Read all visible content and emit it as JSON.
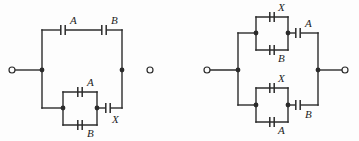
{
  "figure": {
    "background_color": "#fdfdfd",
    "line_color": "#2b2b2b",
    "label_color": "#1e1e1e",
    "width": 359,
    "height": 141
  },
  "circuits": [
    {
      "id": "left-circuit",
      "name": "left-capacitor-network",
      "description": "Series-parallel capacitor network: top branch has A and B in series; bottom branch has A parallel with B, in series with X.",
      "terminals": [
        {
          "name": "left-terminal",
          "cx": 12,
          "cy": 70,
          "r": 3
        },
        {
          "name": "right-terminal",
          "cx": 150,
          "cy": 70,
          "r": 3
        }
      ],
      "junctions": [
        {
          "name": "left-junction",
          "cx": 42,
          "cy": 70,
          "r": 2.4
        },
        {
          "name": "right-junction",
          "cx": 122,
          "cy": 70,
          "r": 2.4
        },
        {
          "name": "parallel-left-node",
          "cx": 63,
          "cy": 108,
          "r": 2.4
        },
        {
          "name": "parallel-right-node",
          "cx": 97,
          "cy": 108,
          "r": 2.4
        }
      ],
      "wires": [
        {
          "name": "left-terminal-lead",
          "d": "M 12 70 L 42 70"
        },
        {
          "name": "left-rail",
          "d": "M 42 30 L 42 108"
        },
        {
          "name": "top-branch-left",
          "d": "M 42 30 L 60 30"
        },
        {
          "name": "top-branch-middle",
          "d": "M 66 30 L 101 30"
        },
        {
          "name": "top-branch-right",
          "d": "M 107 30 L 122 30"
        },
        {
          "name": "right-rail",
          "d": "M 122 30 L 122 108"
        },
        {
          "name": "bottom-branch-left",
          "d": "M 42 108 L 63 108"
        },
        {
          "name": "parallel-box-top",
          "d": "M 63 92 L 97 92"
        },
        {
          "name": "parallel-box-bottom",
          "d": "M 63 125 L 97 125"
        },
        {
          "name": "parallel-box-left-side",
          "d": "M 63 92 L 63 125"
        },
        {
          "name": "parallel-box-right-side",
          "d": "M 97 92 L 97 125"
        },
        {
          "name": "bottom-branch-to-x",
          "d": "M 97 108 L 105 108"
        },
        {
          "name": "bottom-branch-x-to-rail",
          "d": "M 111 108 L 122 108"
        }
      ],
      "capacitors": [
        {
          "name": "capacitor-A-top",
          "label": "A",
          "orientation": "vertical-plates",
          "cx": 63,
          "cy": 30,
          "label_x": 70,
          "label_y": 21
        },
        {
          "name": "capacitor-B-top",
          "label": "B",
          "orientation": "vertical-plates",
          "cx": 104,
          "cy": 30,
          "label_x": 111,
          "label_y": 21
        },
        {
          "name": "capacitor-A-parallel",
          "label": "A",
          "orientation": "vertical-plates",
          "cx": 80,
          "cy": 92,
          "label_x": 87,
          "label_y": 83
        },
        {
          "name": "capacitor-B-parallel",
          "label": "B",
          "orientation": "vertical-plates",
          "cx": 80,
          "cy": 125,
          "label_x": 87,
          "label_y": 134
        },
        {
          "name": "capacitor-X-series",
          "label": "X",
          "orientation": "vertical-plates",
          "cx": 108,
          "cy": 108,
          "label_x": 112,
          "label_y": 120
        }
      ]
    },
    {
      "id": "right-circuit",
      "name": "right-capacitor-network",
      "description": "Two parallel branches: top branch has X parallel with B in series with A; bottom branch has X parallel with A in series with B.",
      "terminals": [
        {
          "name": "left-terminal",
          "cx": 207,
          "cy": 70,
          "r": 3
        },
        {
          "name": "right-terminal",
          "cx": 345,
          "cy": 70,
          "r": 3
        }
      ],
      "junctions": [
        {
          "name": "left-junction",
          "cx": 238,
          "cy": 70,
          "r": 2.4
        },
        {
          "name": "right-junction",
          "cx": 318,
          "cy": 70,
          "r": 2.4
        },
        {
          "name": "top-parallel-left-node",
          "cx": 256,
          "cy": 33,
          "r": 2.4
        },
        {
          "name": "top-parallel-right-node",
          "cx": 288,
          "cy": 33,
          "r": 2.4
        },
        {
          "name": "bottom-parallel-left-node",
          "cx": 256,
          "cy": 105,
          "r": 2.4
        },
        {
          "name": "bottom-parallel-right-node",
          "cx": 288,
          "cy": 105,
          "r": 2.4
        }
      ],
      "wires": [
        {
          "name": "left-terminal-lead",
          "d": "M 207 70 L 238 70"
        },
        {
          "name": "left-rail",
          "d": "M 238 33 L 238 105"
        },
        {
          "name": "top-branch-left",
          "d": "M 238 33 L 256 33"
        },
        {
          "name": "top-parallel-box-top",
          "d": "M 256 17 L 288 17"
        },
        {
          "name": "top-parallel-box-bottom",
          "d": "M 256 50 L 288 50"
        },
        {
          "name": "top-parallel-box-left-side",
          "d": "M 256 17 L 256 50"
        },
        {
          "name": "top-parallel-box-right-side",
          "d": "M 288 17 L 288 50"
        },
        {
          "name": "top-branch-to-A",
          "d": "M 288 33 L 295 33"
        },
        {
          "name": "top-branch-A-to-rail",
          "d": "M 301 33 L 318 33"
        },
        {
          "name": "right-rail",
          "d": "M 318 33 L 318 105"
        },
        {
          "name": "bottom-branch-left",
          "d": "M 238 105 L 256 105"
        },
        {
          "name": "bottom-parallel-box-top",
          "d": "M 256 88 L 288 88"
        },
        {
          "name": "bottom-parallel-box-bottom",
          "d": "M 256 122 L 288 122"
        },
        {
          "name": "bottom-parallel-box-left-side",
          "d": "M 256 88 L 256 122"
        },
        {
          "name": "bottom-parallel-box-right-side",
          "d": "M 288 88 L 288 122"
        },
        {
          "name": "bottom-branch-to-B",
          "d": "M 288 105 L 295 105"
        },
        {
          "name": "bottom-branch-B-to-rail",
          "d": "M 301 105 L 318 105"
        },
        {
          "name": "right-terminal-lead",
          "d": "M 318 70 L 345 70"
        }
      ],
      "capacitors": [
        {
          "name": "capacitor-X-top-parallel",
          "label": "X",
          "orientation": "vertical-plates",
          "cx": 272,
          "cy": 17,
          "label_x": 278,
          "label_y": 8
        },
        {
          "name": "capacitor-B-top-parallel",
          "label": "B",
          "orientation": "vertical-plates",
          "cx": 272,
          "cy": 50,
          "label_x": 278,
          "label_y": 59
        },
        {
          "name": "capacitor-A-top-series",
          "label": "A",
          "orientation": "vertical-plates",
          "cx": 298,
          "cy": 33,
          "label_x": 305,
          "label_y": 24
        },
        {
          "name": "capacitor-X-bottom-parallel",
          "label": "X",
          "orientation": "vertical-plates",
          "cx": 272,
          "cy": 88,
          "label_x": 278,
          "label_y": 79
        },
        {
          "name": "capacitor-A-bottom-parallel",
          "label": "A",
          "orientation": "vertical-plates",
          "cx": 272,
          "cy": 122,
          "label_x": 278,
          "label_y": 131
        },
        {
          "name": "capacitor-B-bottom-series",
          "label": "B",
          "orientation": "vertical-plates",
          "cx": 298,
          "cy": 105,
          "label_x": 305,
          "label_y": 115
        }
      ]
    }
  ]
}
